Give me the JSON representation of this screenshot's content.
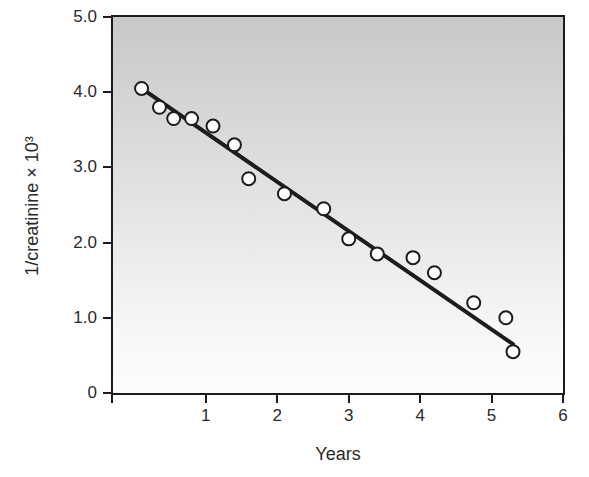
{
  "figure": {
    "background": "#ffffff"
  },
  "chart_data": {
    "type": "scatter",
    "title": "",
    "xlabel": "Years",
    "ylabel": "1/creatinine × 10³",
    "xlim": [
      -0.3,
      6
    ],
    "ylim": [
      0,
      5
    ],
    "grid": false,
    "legend": false,
    "xticks": [
      {
        "value": 1,
        "label": "1"
      },
      {
        "value": 2,
        "label": "2"
      },
      {
        "value": 3,
        "label": "3"
      },
      {
        "value": 4,
        "label": "4"
      },
      {
        "value": 5,
        "label": "5"
      },
      {
        "value": 6,
        "label": "6"
      }
    ],
    "yticks": [
      {
        "value": 5,
        "label": "5.0"
      },
      {
        "value": 4,
        "label": "4.0"
      },
      {
        "value": 3,
        "label": "3.0"
      },
      {
        "value": 2,
        "label": "2.0"
      },
      {
        "value": 1,
        "label": "1.0"
      },
      {
        "value": 0,
        "label": "0"
      }
    ],
    "series": [
      {
        "name": "1/creatinine measurements",
        "marker": "open-circle",
        "points": [
          [
            0.1,
            4.05
          ],
          [
            0.35,
            3.8
          ],
          [
            0.55,
            3.65
          ],
          [
            0.8,
            3.65
          ],
          [
            1.1,
            3.55
          ],
          [
            1.4,
            3.3
          ],
          [
            1.6,
            2.85
          ],
          [
            2.1,
            2.65
          ],
          [
            2.65,
            2.45
          ],
          [
            3.0,
            2.05
          ],
          [
            3.4,
            1.85
          ],
          [
            3.9,
            1.8
          ],
          [
            4.2,
            1.6
          ],
          [
            4.75,
            1.2
          ],
          [
            5.2,
            1.0
          ],
          [
            5.3,
            0.55
          ]
        ]
      }
    ],
    "trend_line": {
      "x1": 0.1,
      "y1": 4.05,
      "x2": 5.3,
      "y2": 0.65
    },
    "colors": {
      "marker_fill": "#ffffff",
      "marker_stroke": "#1c1c1c",
      "trend_line": "#1c1c1c",
      "axis": "#1c1c1c",
      "text": "#2a2a2a",
      "plot_bg_top": "#c8c8c8",
      "plot_bg_mid": "#e4e4e4",
      "plot_bg_bottom": "#fdfdfd"
    }
  }
}
